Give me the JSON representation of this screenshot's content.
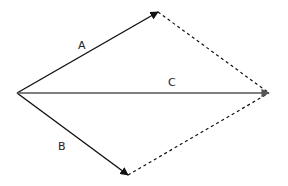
{
  "diagram": {
    "type": "vector-addition-parallelogram",
    "origin": {
      "x": 17,
      "y": 93
    },
    "vectors": [
      {
        "id": "A",
        "label": "A",
        "from": [
          17,
          93
        ],
        "to": [
          158,
          12
        ],
        "style": "solid",
        "color": "#111111",
        "label_pos": [
          82,
          49
        ]
      },
      {
        "id": "B",
        "label": "B",
        "from": [
          17,
          93
        ],
        "to": [
          128,
          175
        ],
        "style": "solid",
        "color": "#111111",
        "label_pos": [
          62,
          150
        ]
      },
      {
        "id": "C",
        "label": "C",
        "from": [
          17,
          93
        ],
        "to": [
          269,
          93
        ],
        "style": "solid",
        "color": "#555555",
        "label_pos": [
          172,
          86
        ]
      }
    ],
    "dashed_lines": [
      {
        "from": [
          158,
          12
        ],
        "to": [
          269,
          93
        ]
      },
      {
        "from": [
          128,
          175
        ],
        "to": [
          269,
          93
        ]
      }
    ]
  }
}
